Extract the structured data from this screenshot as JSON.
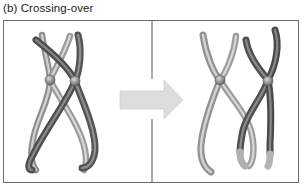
{
  "figure": {
    "caption": "(b) Crossing-over",
    "panels": [
      {
        "id": "before",
        "description": "Homologous chromosome pair before crossing-over, non-sister chromatids crossed"
      },
      {
        "id": "after",
        "description": "Chromosomes after crossing-over with exchanged chromatid segments"
      }
    ],
    "arrow": {
      "direction": "right",
      "color": "#d9d9d9"
    },
    "colors": {
      "light_chromatid": "#a8a8a8",
      "light_chromatid_highlight": "#d4d4d4",
      "dark_chromatid": "#5e5e5e",
      "dark_chromatid_highlight": "#8c8c8c",
      "centromere": "#8a8a8a",
      "frame": "#6a6a6a",
      "divider": "#555555"
    }
  }
}
